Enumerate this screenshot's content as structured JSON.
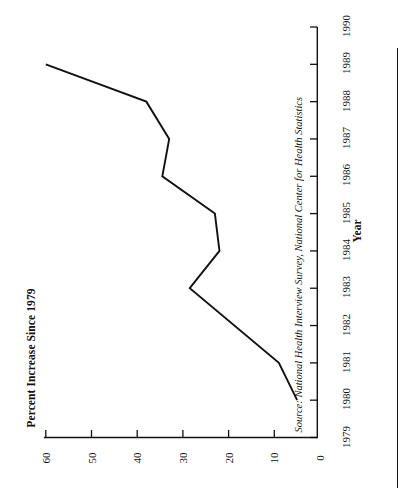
{
  "figure": {
    "orientation": "rotated-90-ccw",
    "percent_axis_title": "Percent Increase Since 1979",
    "year_axis_title": "Year",
    "source_note": "Source: National Health Interview Survey, National Center for Health Statistics",
    "line_color": "#111111",
    "background_color": "#ffffff"
  },
  "percent_axis": {
    "ticks": [
      "60",
      "50",
      "40",
      "30",
      "20",
      "10",
      "0"
    ],
    "values": [
      60,
      50,
      40,
      30,
      20,
      10,
      0
    ]
  },
  "year_axis": {
    "ticks": [
      "1979",
      "1980",
      "1981",
      "1982",
      "1983",
      "1984",
      "1985",
      "1986",
      "1987",
      "1988",
      "1989",
      "1990"
    ],
    "values": [
      1979,
      1980,
      1981,
      1982,
      1983,
      1984,
      1985,
      1986,
      1987,
      1988,
      1989,
      1990
    ]
  },
  "chart_data": {
    "type": "line",
    "title": "",
    "xlabel": "Year",
    "ylabel": "Percent Increase Since 1979",
    "annotations": [
      "Source: National Health Interview Survey, National Center for Health Statistics"
    ],
    "orientation": "horizontal-bars-rotated",
    "grid": false,
    "legend": "none",
    "xlim": [
      1979,
      1990
    ],
    "ylim": [
      0,
      60
    ],
    "x": [
      1980,
      1981,
      1983,
      1984,
      1985,
      1986,
      1987,
      1988,
      1989
    ],
    "categories": [
      "1980",
      "1981",
      "1983",
      "1984",
      "1985",
      "1986",
      "1987",
      "1988",
      "1989"
    ],
    "values": [
      5,
      9,
      28.5,
      22,
      23,
      34.5,
      33,
      38,
      60
    ],
    "series": [
      {
        "name": "Percent Increase Since 1979",
        "values": [
          5,
          9,
          28.5,
          22,
          23,
          34.5,
          33,
          38,
          60
        ]
      }
    ]
  }
}
